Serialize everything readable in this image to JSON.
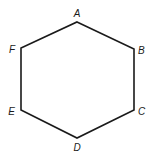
{
  "diagram": {
    "type": "hexagon",
    "stroke_color": "#1a1a1a",
    "stroke_width": 1.6,
    "vertices": [
      {
        "label": "A",
        "x": 77,
        "y": 22,
        "label_x": 77,
        "label_y": 17,
        "anchor": "middle"
      },
      {
        "label": "B",
        "x": 134,
        "y": 49,
        "label_x": 138,
        "label_y": 54,
        "anchor": "start"
      },
      {
        "label": "C",
        "x": 134,
        "y": 110,
        "label_x": 138,
        "label_y": 115,
        "anchor": "start"
      },
      {
        "label": "D",
        "x": 77,
        "y": 138,
        "label_x": 77,
        "label_y": 151,
        "anchor": "middle"
      },
      {
        "label": "E",
        "x": 21,
        "y": 110,
        "label_x": 15,
        "label_y": 115,
        "anchor": "end"
      },
      {
        "label": "F",
        "x": 21,
        "y": 48,
        "label_x": 15,
        "label_y": 53,
        "anchor": "end"
      }
    ]
  }
}
